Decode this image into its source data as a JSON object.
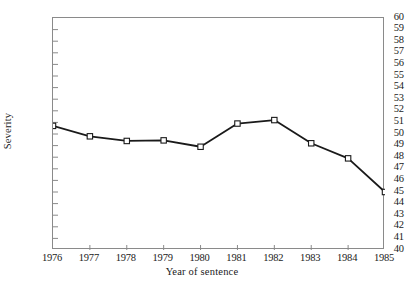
{
  "chart_data": {
    "type": "line",
    "title": "",
    "xlabel": "Year of sentence",
    "ylabel": "Severity",
    "x": [
      1976,
      1977,
      1978,
      1979,
      1980,
      1981,
      1982,
      1983,
      1984,
      1985
    ],
    "categories": [
      "1976",
      "1977",
      "1978",
      "1979",
      "1980",
      "1981",
      "1982",
      "1983",
      "1984",
      "1985"
    ],
    "values": [
      50.7,
      49.8,
      49.4,
      49.45,
      48.9,
      50.9,
      51.2,
      49.2,
      47.9,
      45.0
    ],
    "series": [
      {
        "name": "Severity",
        "values": [
          50.7,
          49.8,
          49.4,
          49.45,
          48.9,
          50.9,
          51.2,
          49.2,
          47.9,
          45.0
        ]
      }
    ],
    "ylim": [
      40,
      60
    ],
    "xlim": [
      1976,
      1985
    ],
    "ytick_step": 1,
    "yticks": [
      60,
      59,
      58,
      57,
      56,
      55,
      54,
      53,
      52,
      51,
      50,
      49,
      48,
      47,
      46,
      45,
      44,
      43,
      42,
      41,
      40
    ],
    "ytick_labels": [
      "60",
      "59",
      "58",
      "57",
      "56",
      "55",
      "54",
      "53",
      "52",
      "51",
      "50",
      "49",
      "48",
      "47",
      "46",
      "45",
      "44",
      "43",
      "42",
      "41",
      "40"
    ],
    "xticks": [
      1976,
      1977,
      1978,
      1979,
      1980,
      1981,
      1982,
      1983,
      1984,
      1985
    ],
    "xtick_labels": [
      "1976",
      "1977",
      "1978",
      "1979",
      "1980",
      "1981",
      "1982",
      "1983",
      "1984",
      "1985"
    ],
    "grid": false,
    "legend": null,
    "legend_position": "none",
    "marker": "open-square",
    "line_color": "#1a1a1a",
    "marker_face_color": "#ffffff",
    "marker_edge_color": "#1a1a1a",
    "axis_color": "#8a8a8a",
    "annotations": []
  },
  "caption": {
    "text": ""
  }
}
